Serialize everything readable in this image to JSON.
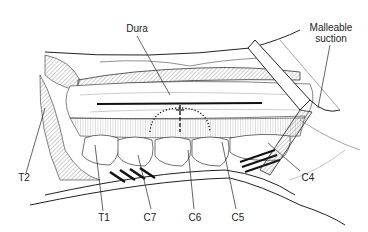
{
  "figure": {
    "type": "surgical illustration",
    "labels": {
      "dura": "Dura",
      "malleable_suction_line1": "Malleable",
      "malleable_suction_line2": "suction",
      "t2": "T2",
      "t1": "T1",
      "c7": "C7",
      "c6": "C6",
      "c5": "C5",
      "c4": "C4"
    },
    "colors": {
      "ink": "#222222",
      "background": "#ffffff"
    }
  }
}
